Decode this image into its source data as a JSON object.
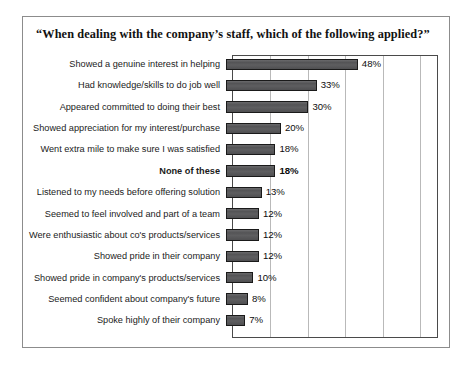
{
  "chart_data": {
    "type": "bar",
    "orientation": "horizontal",
    "title": "“When dealing with the company’s staff, which of the following applied?”",
    "xlabel": "",
    "ylabel": "",
    "xlim": [
      0,
      75
    ],
    "grid": true,
    "gridlines_percent": [
      13.6,
      27.3,
      40.9,
      54.5,
      68.2
    ],
    "value_suffix": "%",
    "legend": null,
    "legend_position": "none",
    "bar_color": "#58585a",
    "bar_border_color": "#1a1a1a",
    "categories": [
      "Showed a genuine interest in helping",
      "Had knowledge/skills to do job well",
      "Appeared committed to doing their best",
      "Showed appreciation for my interest/purchase",
      "Went extra mile to make sure I was satisfied",
      "None of these",
      "Listened to my needs before offering solution",
      "Seemed to feel involved and part of a team",
      "Were enthusiastic about co's products/services",
      "Showed pride in their company",
      "Showed pride in company's products/services",
      "Seemed confident about company's future",
      "Spoke highly of their company"
    ],
    "values": [
      48,
      33,
      30,
      20,
      18,
      18,
      13,
      12,
      12,
      12,
      10,
      8,
      7
    ],
    "value_labels": [
      "48%",
      "33%",
      "30%",
      "20%",
      "18%",
      "18%",
      "13%",
      "12%",
      "12%",
      "12%",
      "10%",
      "8%",
      "7%"
    ],
    "emphasized_index": 5
  }
}
